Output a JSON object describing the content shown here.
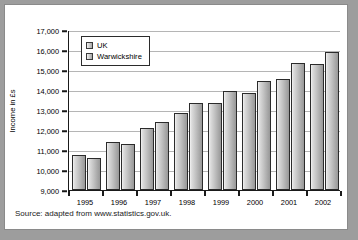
{
  "chart_data": {
    "type": "bar",
    "title": "",
    "xlabel": "",
    "ylabel": "Income in £s",
    "categories": [
      "1995",
      "1996",
      "1997",
      "1998",
      "1999",
      "2000",
      "2001",
      "2002"
    ],
    "series": [
      {
        "name": "UK",
        "values": [
          10770,
          11380,
          12120,
          12830,
          13330,
          13870,
          14530,
          15280
        ]
      },
      {
        "name": "Warwickshire",
        "values": [
          10620,
          11280,
          12420,
          13370,
          13970,
          14440,
          15350,
          15890
        ]
      }
    ],
    "ylim": [
      9000,
      17000
    ],
    "ytick_values": [
      9000,
      10000,
      11000,
      12000,
      13000,
      14000,
      15000,
      16000,
      17000
    ],
    "ytick_labels": [
      "9,000",
      "10,000",
      "11,000",
      "12,000",
      "13,000",
      "14,000",
      "15,000",
      "16,000",
      "17,000"
    ],
    "grid": true,
    "legend_position": "upper-left"
  },
  "legend": {
    "items": [
      {
        "label": "UK"
      },
      {
        "label": "Warwickshire"
      }
    ]
  },
  "source": {
    "text": "Source: adapted from www.statistics.gov.uk."
  }
}
